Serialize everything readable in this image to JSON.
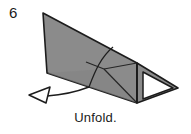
{
  "diagram": {
    "kind": "origami-fold-instruction",
    "step_number": "6",
    "caption": "Unfold.",
    "colors": {
      "paper_fill": "#8b8b8b",
      "paper_fill_shaded": "#858585",
      "paper_fill_light": "#959595",
      "outline": "#1c1c1c",
      "fold_line": "#2a2a2a",
      "hole_fill": "#ffffff",
      "arrow_stroke": "#1c1c1c",
      "arrow_fill": "#ffffff",
      "background": "#ffffff",
      "text": "#1a1a1a"
    },
    "shapes": {
      "main_body_points": "43,13 137,63 137,103 47,73",
      "right_wedge_points": "137,63 178,88 137,103",
      "hole_points": "143,72 172,88 143,99",
      "fold_lines": [
        "104,69 137,63",
        "104,69 137,103",
        "104,69 88,63",
        "137,63 137,103"
      ],
      "curved_fold": "M 113,47 C 101,58 95,72 88,88",
      "arrow_shaft": "M 88,88 C 75,92 60,95 45,96",
      "arrow_head_points": "30,95 49,88 46,102"
    },
    "elements": {
      "step_number_name": "step-number-label",
      "caption_name": "instruction-caption",
      "figure_name": "origami-figure"
    }
  }
}
